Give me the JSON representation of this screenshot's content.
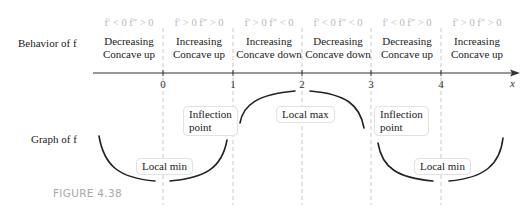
{
  "row_labels": {
    "behavior": "Behavior of f",
    "graph": "Graph of f"
  },
  "intervals": [
    {
      "sign": "f′ < 0 f″ > 0",
      "line1": "Decreasing",
      "line2": "Concave up"
    },
    {
      "sign": "f′ > 0 f″ > 0",
      "line1": "Increasing",
      "line2": "Concave up"
    },
    {
      "sign": "f′ > 0 f″ < 0",
      "line1": "Increasing",
      "line2": "Concave down"
    },
    {
      "sign": "f′ < 0 f″ < 0",
      "line1": "Decreasing",
      "line2": "Concave down"
    },
    {
      "sign": "f′ < 0 f″ > 0",
      "line1": "Decreasing",
      "line2": "Concave up"
    },
    {
      "sign": "f′ > 0 f″ > 0",
      "line1": "Increasing",
      "line2": "Concave up"
    }
  ],
  "axis": {
    "ticks": [
      "0",
      "1",
      "2",
      "3",
      "4"
    ],
    "label": "x"
  },
  "callouts": {
    "local_min_1": "Local min",
    "inflection_1_line1": "Inflection",
    "inflection_1_line2": "point",
    "local_max": "Local max",
    "inflection_2_line1": "Inflection",
    "inflection_2_line2": "point",
    "local_min_2": "Local min"
  },
  "caption": "FIGURE 4.38",
  "colors": {
    "curve": "#222222",
    "axis": "#333333",
    "dashed_guides": "#c8c8c8",
    "sign_text": "#b9b9b9",
    "caption": "#a8a8a8"
  }
}
